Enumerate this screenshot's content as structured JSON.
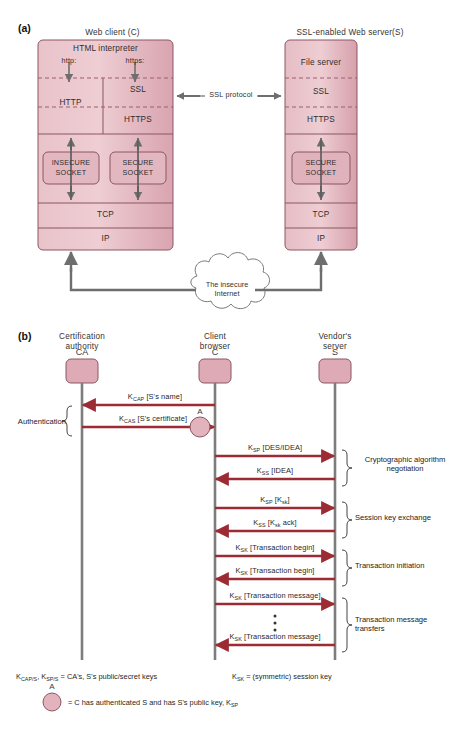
{
  "figure": {
    "panel_a": {
      "tag": "(a)",
      "client_title": "Web client (C)",
      "server_title": "SSL-enabled Web server(S)",
      "client_layers": {
        "html_interpreter": "HTML interpreter",
        "http_scheme": "http:",
        "https_scheme": "https:",
        "http": "HTTP",
        "ssl": "SSL",
        "https": "HTTPS",
        "insecure_socket_line1": "INSECURE",
        "insecure_socket_line2": "SOCKET",
        "secure_socket_line1": "SECURE",
        "secure_socket_line2": "SOCKET",
        "tcp": "TCP",
        "ip": "IP"
      },
      "server_layers": {
        "file_server": "File server",
        "ssl": "SSL",
        "https": "HTTPS",
        "secure_socket_line1": "SECURE",
        "secure_socket_line2": "SOCKET",
        "tcp": "TCP",
        "ip": "IP"
      },
      "ssl_protocol_label": "SSL protocol",
      "cloud_line1": "The insecure",
      "cloud_line2": "Internet"
    },
    "panel_b": {
      "tag": "(b)",
      "actors": [
        {
          "title_line1": "Certification",
          "title_line2": "authority",
          "symbol": "CA"
        },
        {
          "title_line1": "Client",
          "title_line2": "browser",
          "symbol": "C"
        },
        {
          "title_line1": "Vendor's",
          "title_line2": "server",
          "symbol": "S"
        }
      ],
      "auth_brace_label": "Authentication",
      "a_marker": "A",
      "messages": [
        {
          "label_html": "K<sub>CAP</sub> [S's name]",
          "from": "C",
          "to": "CA",
          "dir": "left"
        },
        {
          "label_html": "K<sub>CAS</sub> [S's certificate]",
          "from": "CA",
          "to": "C",
          "dir": "right"
        },
        {
          "label_html": "K<sub>SP</sub> [DES/IDEA]",
          "from": "C",
          "to": "S",
          "dir": "right"
        },
        {
          "label_html": "K<sub>SS</sub> [IDEA]",
          "from": "S",
          "to": "C",
          "dir": "left"
        },
        {
          "label_html": "K<sub>SP</sub> [K<sub>sk</sub>]",
          "from": "C",
          "to": "S",
          "dir": "right"
        },
        {
          "label_html": "K<sub>SS</sub> [K<sub>sk</sub> ack]",
          "from": "S",
          "to": "C",
          "dir": "left"
        },
        {
          "label_html": "K<sub>SK</sub> [Transaction begin]",
          "from": "C",
          "to": "S",
          "dir": "right"
        },
        {
          "label_html": "K<sub>SK</sub> [Transaction begin]",
          "from": "S",
          "to": "C",
          "dir": "left"
        },
        {
          "label_html": "K<sub>SK</sub> [Transaction message]",
          "from": "C",
          "to": "S",
          "dir": "right"
        },
        {
          "label_html": "K<sub>SK</sub> [Transaction message]",
          "from": "S",
          "to": "C",
          "dir": "left"
        }
      ],
      "phase_labels": [
        {
          "line1": "Cryptographic algorithm",
          "line2": "negotiation"
        },
        {
          "line1": "Session key exchange",
          "line2": ""
        },
        {
          "line1": "Transaction initiation",
          "line2": ""
        },
        {
          "line1": "Transaction message",
          "line2": "transfers"
        }
      ],
      "legend": {
        "keys_html": "K<sub>CAP/S</sub>, K<sub>SP/S</sub> =  CA's, S's public/secret keys",
        "session_html": "K<sub>SK</sub> = (symmetric) session key",
        "a_marker": "A",
        "a_meaning_html": "= C has authenticated S and has S's public key, K<sub>SP</sub>"
      }
    }
  },
  "colors": {
    "box_fill_light": "#eec9cf",
    "box_fill_dark": "#d9a3ae",
    "box_stroke": "#8c5663",
    "arrow_gray": "#6e6e6e",
    "arrow_red": "#9c2b33",
    "text": "#2b2b2b",
    "node_fill": "#ddaab5"
  }
}
